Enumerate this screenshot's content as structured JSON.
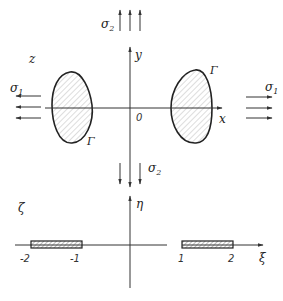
{
  "top_figure": {
    "axes": {
      "horizontal_label": "x",
      "vertical_label": "y",
      "origin_label": "0"
    },
    "plane_label": "z",
    "contour_labels": [
      "Γ",
      "Γ"
    ],
    "stress_labels": {
      "left": "σ",
      "left_sub": "1",
      "right": "σ",
      "right_sub": "1",
      "top": "σ",
      "top_sub": "2",
      "bottom": "σ",
      "bottom_sub": "2"
    }
  },
  "bottom_figure": {
    "axes": {
      "horizontal_label": "ξ",
      "vertical_label": "η"
    },
    "plane_label": "ζ",
    "tick_labels": [
      "-2",
      "-1",
      "1",
      "2"
    ]
  }
}
